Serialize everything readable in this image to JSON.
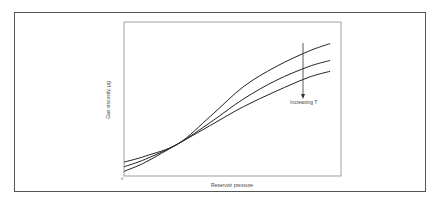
{
  "chart_data": {
    "type": "line",
    "title": "",
    "xlabel": "Reservoir pressure",
    "ylabel": "Gas viscosity, μg",
    "origin_label": "0",
    "annotation": "Increasing T",
    "annotation_arrow": {
      "direction": "down",
      "x": 0.82
    },
    "axis_ticks": "none",
    "grid": false,
    "legend": "none",
    "x": [
      0.0,
      0.1,
      0.25,
      0.4,
      0.55,
      0.7,
      0.85,
      0.95
    ],
    "series": [
      {
        "name": "Low T",
        "values": [
          0.09,
          0.13,
          0.21,
          0.39,
          0.58,
          0.71,
          0.81,
          0.86
        ]
      },
      {
        "name": "Medium T",
        "values": [
          0.06,
          0.11,
          0.21,
          0.35,
          0.5,
          0.62,
          0.71,
          0.75
        ]
      },
      {
        "name": "High T",
        "values": [
          0.03,
          0.09,
          0.21,
          0.33,
          0.45,
          0.55,
          0.64,
          0.68
        ]
      }
    ],
    "xlim": [
      0,
      1
    ],
    "ylim": [
      0,
      1
    ]
  },
  "labels": {
    "xlabel": "Reservoir pressure",
    "ylabel": "Gas viscosity, μg",
    "origin": "0",
    "annotation": "Increasing T"
  }
}
